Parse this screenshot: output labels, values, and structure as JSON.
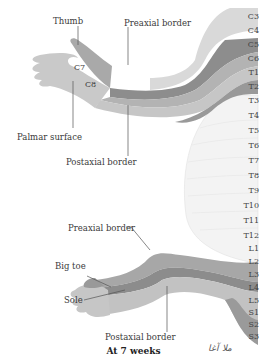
{
  "labels": {
    "thumb": "Thumb",
    "preaxial_upper": "Preaxial border",
    "c7": "C7",
    "c8": "C8",
    "palmar": "Palmar surface",
    "postaxial_upper": "Postaxial border",
    "preaxial_lower": "Preaxial border",
    "big_toe": "Big toe",
    "sole": "Sole",
    "postaxial_lower": "Postaxial border"
  },
  "segments": [
    "C3",
    "C4",
    "C5",
    "C6",
    "T1",
    "T2",
    "T3",
    "T4",
    "T5",
    "T6",
    "T7",
    "T8",
    "T9",
    "T10",
    "T11",
    "T12",
    "L1",
    "L2",
    "L3",
    "L4",
    "L5",
    "S1",
    "S2",
    "S3"
  ],
  "caption": "At 7 weeks",
  "signature": "ملا آغا",
  "colors": {
    "band_light": "#d6d6d6",
    "band_mid": "#b8b8b8",
    "band_dark": "#8e8e8e",
    "trunk": "#f2f2f2",
    "leader": "#555555"
  }
}
